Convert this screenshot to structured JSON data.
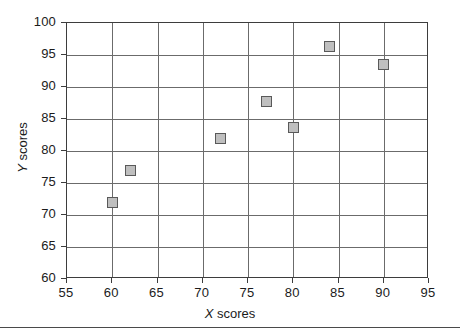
{
  "chart_data": {
    "type": "scatter",
    "title": "",
    "xlabel_prefix": "X",
    "xlabel_suffix": " scores",
    "ylabel_prefix": "Y",
    "ylabel_suffix": " scores",
    "xlim": [
      55,
      95
    ],
    "ylim": [
      60,
      100
    ],
    "xticks": [
      55,
      60,
      65,
      70,
      75,
      80,
      85,
      90,
      95
    ],
    "yticks": [
      60,
      65,
      70,
      75,
      80,
      85,
      90,
      95,
      100
    ],
    "xticklabels": [
      "55",
      "60",
      "65",
      "70",
      "75",
      "80",
      "85",
      "90",
      "95"
    ],
    "yticklabels": [
      "60",
      "65",
      "70",
      "75",
      "80",
      "85",
      "90",
      "95",
      "100"
    ],
    "grid": true,
    "legend": false,
    "marker_shape": "square",
    "marker_fill": "#bfbfbf",
    "marker_edge": "#595959",
    "grid_color": "#6b6b6b",
    "frame_color": "#3d3d3d",
    "points": [
      {
        "x": 60,
        "y": 72.0
      },
      {
        "x": 62,
        "y": 77.0
      },
      {
        "x": 72,
        "y": 82.0
      },
      {
        "x": 77,
        "y": 87.8
      },
      {
        "x": 80,
        "y": 83.7
      },
      {
        "x": 84,
        "y": 96.3
      },
      {
        "x": 90,
        "y": 93.5
      }
    ]
  }
}
